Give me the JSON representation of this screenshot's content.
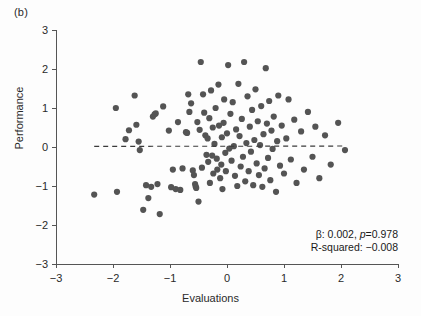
{
  "figure": {
    "panel_label": "(b)",
    "xlabel": "Evaluations",
    "ylabel": "Performance"
  },
  "annotations": {
    "line1_prefix": "β: 0.002, ",
    "line1_italic": "p",
    "line1_suffix": "=0.978",
    "line2": "R-squared: −0.008"
  },
  "chart_data": {
    "type": "scatter",
    "title": "",
    "xlabel": "Evaluations",
    "ylabel": "Performance",
    "xlim": [
      -3,
      3
    ],
    "ylim": [
      -3,
      3
    ],
    "xticks": [
      -3,
      -2,
      -1,
      0,
      1,
      2,
      3
    ],
    "yticks": [
      -3,
      -2,
      -1,
      0,
      1,
      2,
      3
    ],
    "xtick_labels": [
      "−3",
      "−2",
      "−1",
      "0",
      "1",
      "2",
      "3"
    ],
    "ytick_labels": [
      "−3",
      "−2",
      "−1",
      "0",
      "1",
      "2",
      "3"
    ],
    "grid": false,
    "legend": null,
    "marker_color": "#545454",
    "marker_size": 3.1,
    "fit_line": {
      "style": "dashed",
      "color": "#3a3a3a",
      "slope": 0.002,
      "intercept": 0.02,
      "x_start": -2.33,
      "x_end": 2.07
    },
    "stats": {
      "beta": 0.002,
      "p_value": 0.978,
      "r_squared": -0.008
    },
    "n_points": 130,
    "points": [
      [
        -2.33,
        -1.22
      ],
      [
        -1.95,
        1.0
      ],
      [
        -1.93,
        -1.15
      ],
      [
        -1.78,
        0.2
      ],
      [
        -1.72,
        0.43
      ],
      [
        -1.62,
        1.32
      ],
      [
        -1.59,
        0.57
      ],
      [
        -1.55,
        0.14
      ],
      [
        -1.53,
        -0.08
      ],
      [
        -1.47,
        -1.61
      ],
      [
        -1.42,
        -0.98
      ],
      [
        -1.38,
        -1.31
      ],
      [
        -1.33,
        -1.02
      ],
      [
        -1.3,
        0.78
      ],
      [
        -1.27,
        0.84
      ],
      [
        -1.25,
        0.86
      ],
      [
        -1.22,
        -0.95
      ],
      [
        -1.18,
        -1.72
      ],
      [
        -1.12,
        1.04
      ],
      [
        -1.02,
        0.42
      ],
      [
        -0.98,
        -1.03
      ],
      [
        -0.95,
        -0.58
      ],
      [
        -0.9,
        -1.08
      ],
      [
        -0.86,
        0.64
      ],
      [
        -0.82,
        -1.1
      ],
      [
        -0.78,
        -0.55
      ],
      [
        -0.72,
        0.38
      ],
      [
        -0.7,
        0.36
      ],
      [
        -0.68,
        1.35
      ],
      [
        -0.66,
        0.9
      ],
      [
        -0.63,
        1.12
      ],
      [
        -0.6,
        -0.6
      ],
      [
        -0.58,
        -0.72
      ],
      [
        -0.56,
        -0.95
      ],
      [
        -0.55,
        -1.01
      ],
      [
        -0.54,
        -1.05
      ],
      [
        -0.52,
        0.64
      ],
      [
        -0.5,
        -1.4
      ],
      [
        -0.48,
        0.44
      ],
      [
        -0.46,
        2.18
      ],
      [
        -0.44,
        -0.53
      ],
      [
        -0.42,
        1.35
      ],
      [
        -0.4,
        0.88
      ],
      [
        -0.38,
        0.3
      ],
      [
        -0.36,
        -0.2
      ],
      [
        -0.34,
        0.22
      ],
      [
        -0.33,
        -0.38
      ],
      [
        -0.31,
        0.74
      ],
      [
        -0.3,
        -0.92
      ],
      [
        -0.28,
        1.45
      ],
      [
        -0.26,
        -0.22
      ],
      [
        -0.25,
        0.5
      ],
      [
        -0.24,
        -0.68
      ],
      [
        -0.22,
        0.08
      ],
      [
        -0.2,
        1.0
      ],
      [
        -0.18,
        -0.3
      ],
      [
        -0.17,
        -0.58
      ],
      [
        -0.15,
        1.6
      ],
      [
        -0.14,
        0.55
      ],
      [
        -0.12,
        -0.8
      ],
      [
        -0.1,
        -0.45
      ],
      [
        -0.09,
        0.25
      ],
      [
        -0.08,
        -1.08
      ],
      [
        -0.06,
        0.62
      ],
      [
        -0.05,
        1.22
      ],
      [
        -0.03,
        -0.15
      ],
      [
        -0.02,
        -0.62
      ],
      [
        0.0,
        0.35
      ],
      [
        0.02,
        2.1
      ],
      [
        0.04,
        -0.04
      ],
      [
        0.06,
        0.85
      ],
      [
        0.08,
        -0.35
      ],
      [
        0.1,
        1.15
      ],
      [
        0.12,
        0.02
      ],
      [
        0.14,
        -0.74
      ],
      [
        0.16,
        0.45
      ],
      [
        0.18,
        -1.0
      ],
      [
        0.2,
        1.62
      ],
      [
        0.22,
        0.28
      ],
      [
        0.24,
        -0.5
      ],
      [
        0.26,
        0.72
      ],
      [
        0.28,
        -0.25
      ],
      [
        0.3,
        2.18
      ],
      [
        0.32,
        -0.88
      ],
      [
        0.34,
        0.1
      ],
      [
        0.36,
        1.3
      ],
      [
        0.38,
        -0.62
      ],
      [
        0.4,
        0.52
      ],
      [
        0.42,
        -0.12
      ],
      [
        0.44,
        0.95
      ],
      [
        0.46,
        -0.98
      ],
      [
        0.48,
        0.18
      ],
      [
        0.5,
        1.48
      ],
      [
        0.52,
        -0.42
      ],
      [
        0.54,
        0.66
      ],
      [
        0.56,
        -0.72
      ],
      [
        0.58,
        0.05
      ],
      [
        0.6,
        1.05
      ],
      [
        0.62,
        -1.02
      ],
      [
        0.64,
        0.33
      ],
      [
        0.66,
        -0.55
      ],
      [
        0.68,
        2.02
      ],
      [
        0.7,
        0.6
      ],
      [
        0.72,
        -0.28
      ],
      [
        0.74,
        1.18
      ],
      [
        0.76,
        -0.85
      ],
      [
        0.78,
        0.42
      ],
      [
        0.8,
        -0.05
      ],
      [
        0.82,
        0.78
      ],
      [
        0.86,
        -1.15
      ],
      [
        0.88,
        0.15
      ],
      [
        0.9,
        1.32
      ],
      [
        0.93,
        -0.48
      ],
      [
        0.96,
        0.55
      ],
      [
        1.0,
        -0.68
      ],
      [
        1.04,
        0.22
      ],
      [
        1.08,
        1.22
      ],
      [
        1.12,
        -0.32
      ],
      [
        1.18,
        0.7
      ],
      [
        1.22,
        -0.92
      ],
      [
        1.3,
        0.4
      ],
      [
        1.35,
        -0.58
      ],
      [
        1.42,
        0.9
      ],
      [
        1.5,
        -0.25
      ],
      [
        1.55,
        0.52
      ],
      [
        1.62,
        -0.8
      ],
      [
        1.72,
        0.3
      ],
      [
        1.82,
        -0.45
      ],
      [
        1.95,
        0.62
      ],
      [
        2.07,
        -0.08
      ]
    ]
  }
}
